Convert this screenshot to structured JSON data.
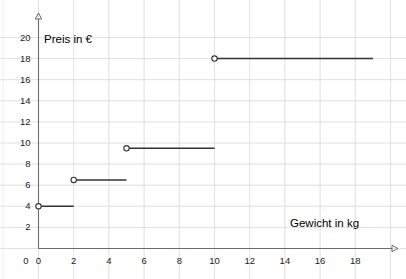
{
  "chart_data": {
    "type": "line",
    "subtype": "step-function",
    "title": "",
    "xlabel": "Gewicht in kg",
    "ylabel": "Preis in €",
    "xlim": [
      0,
      19.6
    ],
    "ylim": [
      0,
      20.8
    ],
    "xticks": [
      0,
      2,
      4,
      6,
      8,
      10,
      12,
      14,
      16,
      18
    ],
    "yticks": [
      0,
      2,
      4,
      6,
      8,
      10,
      12,
      14,
      16,
      18,
      20
    ],
    "grid": true,
    "grid_color": "#d8d8d8",
    "legend": "none",
    "axis_color": "#6b6b6b",
    "series_color": "#333333",
    "marker": "open-circle",
    "segments": [
      {
        "x_start": 0,
        "x_end": 2,
        "y": 4.0,
        "start_marker": "open-circle",
        "end_marker": "none"
      },
      {
        "x_start": 2,
        "x_end": 5,
        "y": 6.5,
        "start_marker": "open-circle",
        "end_marker": "none"
      },
      {
        "x_start": 5,
        "x_end": 10,
        "y": 9.5,
        "start_marker": "open-circle",
        "end_marker": "none"
      },
      {
        "x_start": 10,
        "x_end": 19,
        "y": 18.0,
        "start_marker": "open-circle",
        "end_marker": "none"
      }
    ]
  },
  "axes": {
    "x_title": "Gewicht in kg",
    "y_title": "Preis in €",
    "x_tick_labels": [
      "0",
      "2",
      "4",
      "6",
      "8",
      "10",
      "12",
      "14",
      "16",
      "18"
    ],
    "y_tick_labels": [
      "0",
      "2",
      "4",
      "6",
      "8",
      "10",
      "12",
      "14",
      "16",
      "18",
      "20"
    ]
  }
}
